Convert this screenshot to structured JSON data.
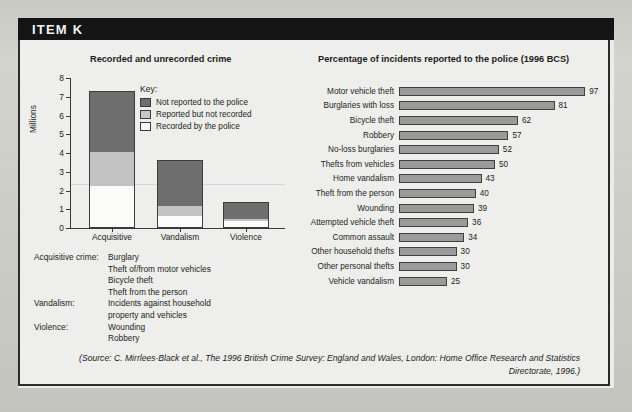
{
  "header": {
    "title": "ITEM K"
  },
  "left_chart": {
    "title": "Recorded and unrecorded crime",
    "ylabel": "Millions",
    "yticks": [
      "8",
      "7",
      "6",
      "5",
      "4",
      "3",
      "2",
      "1",
      "0"
    ],
    "categories": [
      "Acquisitive",
      "Vandalism",
      "Violence"
    ],
    "key": {
      "title": "Key:",
      "items": [
        {
          "label": "Not reported to the police",
          "swatch": "dark-gray-swatch"
        },
        {
          "label": "Reported but not recorded",
          "swatch": "light-gray-swatch"
        },
        {
          "label": "Recorded by the police",
          "swatch": "white-swatch"
        }
      ]
    }
  },
  "right_chart": {
    "title": "Percentage of incidents reported to the police (1996 BCS)"
  },
  "definitions": [
    {
      "term": "Acquisitive crime:",
      "lines": [
        "Burglary",
        "Theft of/from motor vehicles",
        "Bicycle theft",
        "Theft from the person"
      ]
    },
    {
      "term": "Vandalism:",
      "lines": [
        "Incidents against household",
        "property and vehicles"
      ]
    },
    {
      "term": "Violence:",
      "lines": [
        "Wounding",
        "Robbery"
      ]
    }
  ],
  "source": {
    "line1": "(Source: C. Mirrlees-Black et al., The 1996 British Crime Survey: England and Wales, London: Home",
    "line2": "Office Research and Statistics Directorate, 1996.)"
  },
  "colors": {
    "not_reported": "#6e6e6e",
    "reported_not_recorded": "#c2c2c2",
    "recorded": "#fbfbfa",
    "bar_fill": "#9a9a9a",
    "header_bg": "#141414"
  },
  "chart_data": [
    {
      "type": "bar",
      "id": "recorded-and-unrecorded-crime",
      "title": "Recorded and unrecorded crime",
      "xlabel": "",
      "ylabel": "Millions",
      "ylim": [
        0,
        8
      ],
      "yticks": [
        0,
        1,
        2,
        3,
        4,
        5,
        6,
        7,
        8
      ],
      "grid": false,
      "stacked": true,
      "legend": "inside-right",
      "categories": [
        "Acquisitive",
        "Vandalism",
        "Violence"
      ],
      "series": [
        {
          "name": "Recorded by the police",
          "values": [
            2.25,
            0.65,
            0.35
          ]
        },
        {
          "name": "Reported but not recorded",
          "values": [
            1.8,
            0.5,
            0.15
          ]
        },
        {
          "name": "Not reported to the police",
          "values": [
            3.25,
            2.5,
            0.9
          ]
        }
      ],
      "totals": [
        7.3,
        3.65,
        1.4
      ]
    },
    {
      "type": "bar",
      "id": "percentage-reported-to-police",
      "title": "Percentage of incidents reported to the police (1996 BCS)",
      "orientation": "horizontal",
      "xlabel": "",
      "ylabel": "",
      "xlim": [
        0,
        100
      ],
      "grid": false,
      "data_labels": true,
      "categories": [
        "Motor vehicle theft",
        "Burglaries with loss",
        "Bicycle theft",
        "Robbery",
        "No-loss burglaries",
        "Thefts from vehicles",
        "Home vandalism",
        "Theft from the person",
        "Wounding",
        "Attempted vehicle theft",
        "Common assault",
        "Other household thefts",
        "Other personal thefts",
        "Vehicle vandalism"
      ],
      "values": [
        97,
        81,
        62,
        57,
        52,
        50,
        43,
        40,
        39,
        36,
        34,
        30,
        30,
        25
      ]
    }
  ]
}
